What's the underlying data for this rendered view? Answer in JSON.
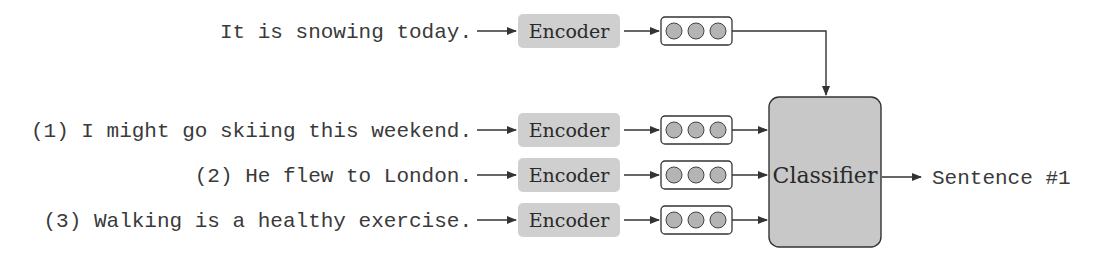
{
  "diagram": {
    "query": {
      "sentence": "It is snowing today.",
      "encoder_label": "Encoder"
    },
    "candidates": [
      {
        "sentence": "(1) I might go skiing this weekend.",
        "encoder_label": "Encoder"
      },
      {
        "sentence": "(2) He flew to London.",
        "encoder_label": "Encoder"
      },
      {
        "sentence": "(3) Walking is a healthy exercise.",
        "encoder_label": "Encoder"
      }
    ],
    "classifier_label": "Classifier",
    "output_label": "Sentence #1",
    "vector_units": 3,
    "colors": {
      "encoder_fill": "#cfcfcf",
      "classifier_fill": "#c8c8c8",
      "circle_fill": "#b4b4b4",
      "stroke": "#333333",
      "text": "#3a3a3a"
    }
  }
}
